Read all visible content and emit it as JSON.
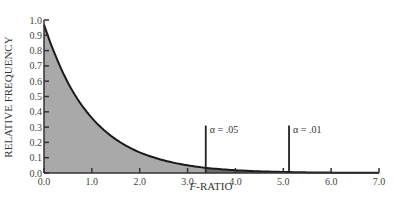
{
  "chart_data": {
    "type": "area",
    "title": "",
    "xlabel_italic": "F",
    "xlabel_rest": "-RATIO",
    "xlabel": "F-RATIO",
    "ylabel": "RELATIVE FREQUENCY",
    "xlim": [
      0.0,
      7.0
    ],
    "ylim": [
      0.0,
      1.0
    ],
    "x_ticks": [
      "0.0",
      "1.0",
      "2.0",
      "3.0",
      "4.0",
      "5.0",
      "6.0",
      "7.0"
    ],
    "y_ticks": [
      "0.0",
      "0.1",
      "0.2",
      "0.3",
      "0.4",
      "0.5",
      "0.6",
      "0.7",
      "0.8",
      "0.9",
      "1.0"
    ],
    "grid": false,
    "series": [
      {
        "name": "F distribution density",
        "x": [
          0.0,
          0.25,
          0.5,
          0.75,
          1.0,
          1.5,
          2.0,
          2.5,
          3.0,
          3.5,
          4.0,
          4.5,
          5.0,
          5.5,
          6.0,
          6.5,
          7.0
        ],
        "values": [
          0.97,
          0.76,
          0.59,
          0.46,
          0.36,
          0.22,
          0.135,
          0.083,
          0.05,
          0.03,
          0.018,
          0.011,
          0.007,
          0.004,
          0.0025,
          0.0015,
          0.001
        ]
      }
    ],
    "annotations": [
      {
        "label": "α = .05",
        "x": 3.38,
        "line_height": 0.31
      },
      {
        "label": "α = .01",
        "x": 5.12,
        "line_height": 0.31
      }
    ],
    "colors": {
      "fill": "#a9a9a9",
      "tail_fill": "#6e6e6e",
      "curve": "#1a1a1a",
      "axis": "#333333"
    }
  }
}
